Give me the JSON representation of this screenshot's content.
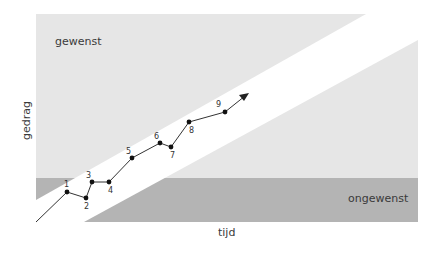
{
  "diagram": {
    "region_desired_label": "gewenst",
    "region_undesired_label": "ongewenst",
    "x_axis_label": "tijd",
    "y_axis_label": "gedrag",
    "colors": {
      "light_region": "#e6e6e6",
      "dark_region": "#b4b4b4",
      "corridor": "#ffffff",
      "line": "#333333"
    },
    "points": [
      {
        "label": "1",
        "x": 67,
        "y": 192
      },
      {
        "label": "2",
        "x": 86,
        "y": 198
      },
      {
        "label": "3",
        "x": 92,
        "y": 182
      },
      {
        "label": "4",
        "x": 109,
        "y": 182
      },
      {
        "label": "5",
        "x": 132,
        "y": 158
      },
      {
        "label": "6",
        "x": 160,
        "y": 143
      },
      {
        "label": "7",
        "x": 171,
        "y": 147
      },
      {
        "label": "8",
        "x": 189,
        "y": 122
      },
      {
        "label": "9",
        "x": 225,
        "y": 112
      }
    ]
  }
}
